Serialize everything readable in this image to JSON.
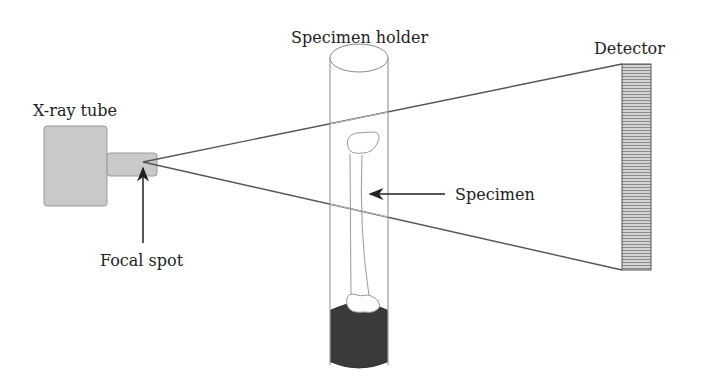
{
  "diagram": {
    "labels": {
      "xray_tube": "X-ray tube",
      "focal_spot": "Focal spot",
      "specimen_holder": "Specimen holder",
      "specimen": "Specimen",
      "detector": "Detector"
    },
    "colors": {
      "tube_fill": "#c9c9c9",
      "beam_line": "#555555",
      "holder_outline": "#888888",
      "mount_fill": "#3a3a3a",
      "detector_fill": "#bdbdbd",
      "text": "#222222"
    }
  }
}
